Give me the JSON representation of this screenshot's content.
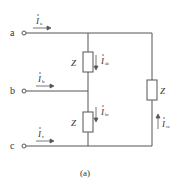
{
  "figure": {
    "caption": "(a)",
    "terminals": [
      {
        "id": "a",
        "label": "a"
      },
      {
        "id": "b",
        "label": "b"
      },
      {
        "id": "c",
        "label": "c"
      }
    ],
    "line_currents": [
      {
        "id": "Ia",
        "symbol": "I",
        "subscript": "a"
      },
      {
        "id": "Ib",
        "symbol": "I",
        "subscript": "b"
      },
      {
        "id": "Ic",
        "symbol": "I",
        "subscript": "c"
      }
    ],
    "phase_currents": [
      {
        "id": "Iab",
        "symbol": "I",
        "subscript": "ab"
      },
      {
        "id": "Ibc",
        "symbol": "I",
        "subscript": "bc"
      },
      {
        "id": "Ica",
        "symbol": "I",
        "subscript": "ca"
      }
    ],
    "impedances": [
      {
        "id": "Zab",
        "label": "Z"
      },
      {
        "id": "Zbc",
        "label": "Z"
      },
      {
        "id": "Zca",
        "label": "Z"
      }
    ],
    "colors": {
      "line": "#555555",
      "text": "#333333"
    }
  }
}
